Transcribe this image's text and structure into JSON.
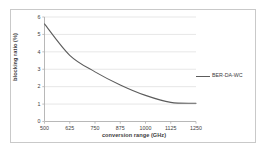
{
  "chart_data": {
    "type": "line",
    "title": "",
    "subtitle": "",
    "xlabel": "conversion range (GHz)",
    "ylabel": "blocking ratio (%)",
    "x": [
      500,
      625,
      750,
      875,
      1000,
      1125,
      1250
    ],
    "xtick_labels": [
      "500",
      "625",
      "750",
      "875",
      "1000",
      "1125",
      "1250"
    ],
    "ytick_labels": [
      "0",
      "1",
      "2",
      "3",
      "4",
      "5",
      "6"
    ],
    "xlim": [
      500,
      1250
    ],
    "ylim": [
      0,
      6
    ],
    "grid": "horizontal",
    "legend_position": "right",
    "series": [
      {
        "name": "BER-DA-WC",
        "color": "#5c5c5c",
        "values": [
          5.6,
          3.8,
          2.85,
          2.1,
          1.5,
          1.1,
          1.05
        ]
      }
    ]
  },
  "legend": {
    "entries": [
      {
        "label": "BER-DA-WC"
      }
    ]
  },
  "axes": {
    "x_title": "conversion range (GHz)",
    "y_title": "blocking ratio (%)"
  }
}
